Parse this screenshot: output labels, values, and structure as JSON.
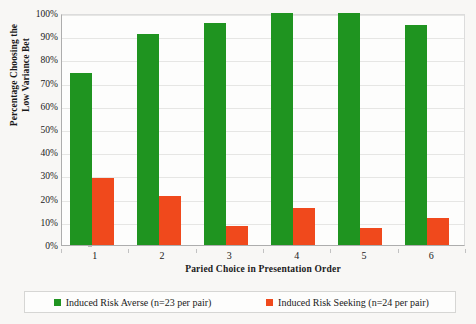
{
  "chart_data": {
    "type": "bar",
    "title": "",
    "xlabel": "Paried Choice in Presentation Order",
    "ylabel_line1": "Percentage Choosing the",
    "ylabel_line2": "Low Variance Bet",
    "categories": [
      "1",
      "2",
      "3",
      "4",
      "5",
      "6"
    ],
    "series": [
      {
        "name": "Induced Risk Averse (n=23 per pair)",
        "color": "#1f9420",
        "values": [
          74,
          91,
          95.5,
          100,
          100,
          95
        ]
      },
      {
        "name": "Induced Risk Seeking (n=24 per pair)",
        "color": "#f0491c",
        "values": [
          29,
          21,
          8,
          16,
          7.5,
          11.5
        ]
      }
    ],
    "ylim": [
      0,
      100
    ],
    "ytick_labels": [
      "100%",
      "90%",
      "80%",
      "70%",
      "60%",
      "50%",
      "40%",
      "30%",
      "20%",
      "10%",
      "0%"
    ],
    "ytick_values": [
      100,
      90,
      80,
      70,
      60,
      50,
      40,
      30,
      20,
      10,
      0
    ],
    "grid": true,
    "legend_position": "bottom"
  }
}
